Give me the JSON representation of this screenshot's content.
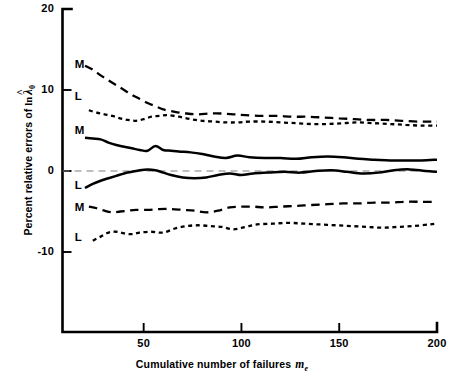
{
  "chart_data": {
    "type": "line",
    "title": "",
    "xlabel": "Cumulative number of failures",
    "xlabel_symbol": "m",
    "xlabel_symbol_sub": "e",
    "ylabel": "Percent relative errors of",
    "ylabel_symbol": "ln",
    "ylabel_symbol_math": "λ",
    "ylabel_symbol_hat": "^",
    "ylabel_symbol_sub": "0",
    "xlim": [
      10,
      200
    ],
    "ylim": [
      -17,
      20
    ],
    "xticks": [
      50,
      100,
      150,
      200
    ],
    "xticklabels": [
      "50",
      "100",
      "150",
      "200"
    ],
    "yticks": [
      20,
      10,
      0,
      -10
    ],
    "yticklabels": [
      "20",
      "10",
      "0",
      "-10"
    ],
    "grid": false,
    "legend": "inline-series-labels",
    "zero_reference_line": 0,
    "series": [
      {
        "name": "M-upper",
        "label": "M",
        "style": "long-dash",
        "label_x": 24,
        "label_y": 13.1,
        "x": [
          20,
          24,
          28,
          32,
          36,
          40,
          44,
          48,
          52,
          56,
          60,
          66,
          72,
          78,
          84,
          90,
          96,
          102,
          110,
          118,
          126,
          134,
          142,
          150,
          158,
          166,
          174,
          182,
          190,
          196,
          200
        ],
        "y": [
          13.0,
          12.5,
          11.8,
          11.2,
          10.6,
          10.0,
          9.4,
          8.9,
          8.4,
          8.0,
          7.6,
          7.3,
          7.1,
          7.0,
          7.1,
          7.1,
          7.0,
          6.9,
          6.8,
          6.8,
          6.7,
          6.7,
          6.6,
          6.5,
          6.4,
          6.3,
          6.3,
          6.2,
          6.1,
          6.1,
          6.1
        ]
      },
      {
        "name": "L-upper",
        "label": "L",
        "style": "short-dash",
        "label_x": 24,
        "label_y": 9.1,
        "x": [
          22,
          26,
          30,
          34,
          38,
          42,
          46,
          50,
          54,
          58,
          62,
          68,
          74,
          80,
          86,
          92,
          98,
          104,
          112,
          120,
          128,
          136,
          144,
          152,
          160,
          168,
          176,
          184,
          192,
          200
        ],
        "y": [
          7.5,
          7.2,
          7.0,
          6.8,
          6.5,
          6.3,
          6.2,
          6.4,
          6.7,
          6.8,
          6.9,
          6.7,
          6.4,
          6.2,
          6.1,
          6.0,
          6.0,
          6.1,
          6.1,
          6.0,
          5.9,
          5.8,
          5.8,
          5.9,
          6.0,
          5.9,
          5.8,
          5.7,
          5.6,
          5.6
        ]
      },
      {
        "name": "M-mid",
        "label": "M",
        "style": "solid",
        "label_x": 24,
        "label_y": 5.0,
        "x": [
          20,
          24,
          28,
          32,
          36,
          40,
          44,
          48,
          52,
          56,
          60,
          64,
          68,
          74,
          80,
          86,
          92,
          98,
          104,
          112,
          120,
          128,
          136,
          144,
          152,
          160,
          168,
          176,
          184,
          192,
          200
        ],
        "y": [
          4.1,
          4.0,
          3.9,
          3.5,
          3.2,
          3.0,
          2.8,
          2.6,
          2.5,
          3.1,
          2.6,
          2.5,
          2.4,
          2.3,
          2.1,
          1.8,
          1.6,
          1.9,
          1.7,
          1.6,
          1.6,
          1.5,
          1.7,
          1.8,
          1.7,
          1.5,
          1.4,
          1.3,
          1.3,
          1.3,
          1.4
        ]
      },
      {
        "name": "L-mid",
        "label": "L",
        "style": "solid",
        "label_x": 24,
        "label_y": -1.9,
        "x": [
          20,
          24,
          28,
          32,
          36,
          40,
          44,
          48,
          52,
          56,
          60,
          64,
          70,
          76,
          82,
          88,
          94,
          100,
          106,
          114,
          122,
          130,
          138,
          146,
          154,
          162,
          170,
          178,
          186,
          194,
          200
        ],
        "y": [
          -2.1,
          -1.6,
          -1.2,
          -0.9,
          -0.6,
          -0.3,
          -0.1,
          0.1,
          0.2,
          0.1,
          -0.2,
          -0.5,
          -0.8,
          -0.9,
          -0.8,
          -0.5,
          -0.3,
          -0.5,
          -0.3,
          -0.2,
          -0.1,
          -0.2,
          0.0,
          0.1,
          -0.1,
          -0.3,
          -0.2,
          0.1,
          0.2,
          0.0,
          -0.1
        ]
      },
      {
        "name": "M-lower",
        "label": "M",
        "style": "long-dash",
        "label_x": 24,
        "label_y": -4.6,
        "x": [
          22,
          26,
          30,
          34,
          38,
          42,
          46,
          52,
          58,
          64,
          70,
          76,
          82,
          88,
          94,
          100,
          106,
          112,
          120,
          128,
          136,
          144,
          152,
          160,
          168,
          176,
          184,
          192,
          200
        ],
        "y": [
          -4.4,
          -4.6,
          -4.9,
          -5.1,
          -5.0,
          -4.9,
          -4.8,
          -4.8,
          -4.7,
          -4.7,
          -4.8,
          -4.9,
          -5.1,
          -4.9,
          -4.5,
          -4.4,
          -4.4,
          -4.5,
          -4.4,
          -4.3,
          -4.2,
          -4.1,
          -4.0,
          -4.0,
          -3.9,
          -3.9,
          -3.8,
          -3.8,
          -3.8
        ]
      },
      {
        "name": "L-lower",
        "label": "L",
        "style": "short-dash",
        "label_x": 24,
        "label_y": -8.3,
        "x": [
          24,
          28,
          32,
          36,
          40,
          44,
          48,
          54,
          60,
          66,
          72,
          78,
          84,
          90,
          96,
          102,
          108,
          116,
          124,
          132,
          140,
          148,
          156,
          164,
          172,
          180,
          188,
          196,
          200
        ],
        "y": [
          -8.6,
          -8.1,
          -7.6,
          -7.5,
          -7.7,
          -7.8,
          -7.6,
          -7.5,
          -7.6,
          -7.1,
          -6.8,
          -6.7,
          -6.8,
          -6.9,
          -7.2,
          -6.9,
          -6.6,
          -6.5,
          -6.4,
          -6.5,
          -6.6,
          -6.7,
          -6.8,
          -6.9,
          -7.0,
          -6.9,
          -6.8,
          -6.6,
          -6.5
        ]
      }
    ]
  }
}
